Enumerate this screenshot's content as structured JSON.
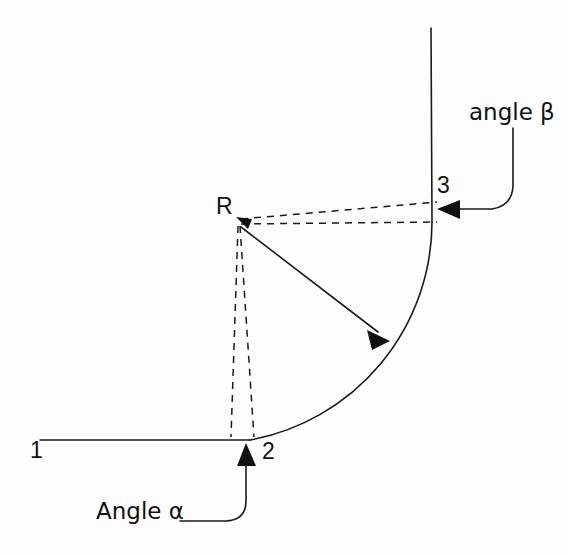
{
  "figure": {
    "background_color": "#fdfdfd",
    "line_color": "#1a1a1a",
    "labels": {
      "point_1": "1",
      "point_2": "2",
      "point_3": "3",
      "radius_center": "R",
      "angle_alpha": "Angle α",
      "angle_beta": "angle β"
    },
    "annotations": {
      "alpha_callout_target": "point-2",
      "beta_callout_target": "point-3",
      "radius_arrow_from": "R",
      "radius_arrow_to": "arc-midpoint"
    },
    "geometry": {
      "center_x": 238,
      "center_y": 220,
      "radius": 220,
      "arc_start_deg": 90,
      "arc_end_deg": 0,
      "horizontal_leg_x1": 40,
      "horizontal_leg_x2": 250,
      "horizontal_leg_y": 440,
      "vertical_leg_x": 458,
      "vertical_leg_y1": 28,
      "vertical_leg_y2": 220
    }
  }
}
